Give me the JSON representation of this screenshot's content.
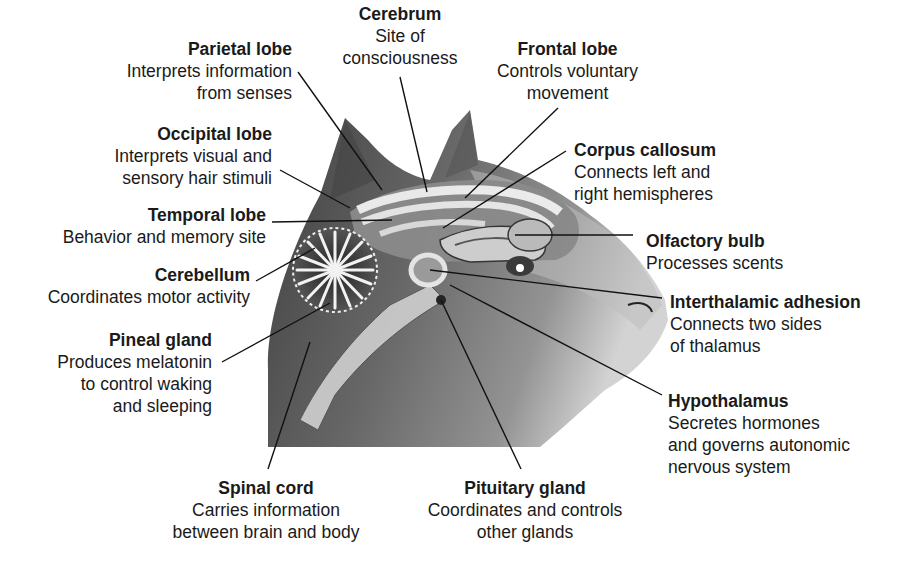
{
  "diagram": {
    "colors": {
      "text": "#1a1a1a",
      "leader": "#111111",
      "fur_dark": "#3a3a3a",
      "fur_mid": "#7a7a7a",
      "brain_light": "#e4e4e4"
    },
    "labels": {
      "cerebrum": {
        "title": "Cerebrum",
        "lines": [
          "Site of",
          "consciousness"
        ]
      },
      "parietal": {
        "title": "Parietal lobe",
        "lines": [
          "Interprets information",
          "from senses"
        ]
      },
      "frontal": {
        "title": "Frontal lobe",
        "lines": [
          "Controls voluntary",
          "movement"
        ]
      },
      "occipital": {
        "title": "Occipital lobe",
        "lines": [
          "Interprets visual and",
          "sensory hair stimuli"
        ]
      },
      "corpus": {
        "title": "Corpus callosum",
        "lines": [
          "Connects left and",
          "right hemispheres"
        ]
      },
      "temporal": {
        "title": "Temporal lobe",
        "lines": [
          "Behavior and memory site"
        ]
      },
      "olfactory": {
        "title": "Olfactory bulb",
        "lines": [
          "Processes scents"
        ]
      },
      "cerebellum": {
        "title": "Cerebellum",
        "lines": [
          "Coordinates motor activity"
        ]
      },
      "interthalamic": {
        "title": "Interthalamic adhesion",
        "lines": [
          "Connects two sides",
          "of thalamus"
        ]
      },
      "pineal": {
        "title": "Pineal gland",
        "lines": [
          "Produces melatonin",
          "to control waking",
          "and sleeping"
        ]
      },
      "hypothalamus": {
        "title": "Hypothalamus",
        "lines": [
          "Secretes hormones",
          "and governs autonomic",
          "nervous system"
        ]
      },
      "spinal": {
        "title": "Spinal cord",
        "lines": [
          "Carries information",
          "between brain and body"
        ]
      },
      "pituitary": {
        "title": "Pituitary gland",
        "lines": [
          "Coordinates and controls",
          "other glands"
        ]
      }
    }
  }
}
